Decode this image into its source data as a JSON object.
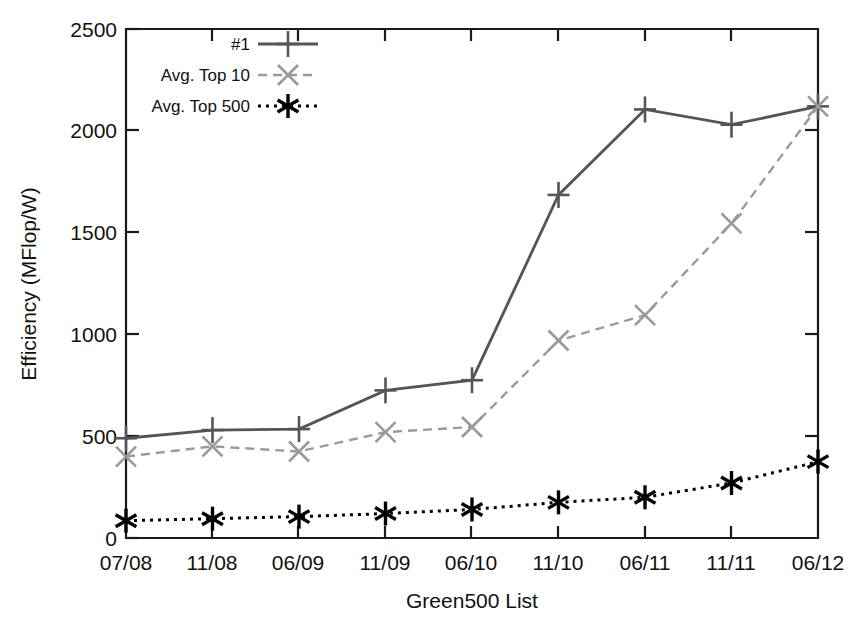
{
  "chart_data": {
    "type": "line",
    "title": "",
    "xlabel": "Green500 List",
    "ylabel": "Efficiency (MFlop/W)",
    "categories": [
      "07/08",
      "11/08",
      "06/09",
      "11/09",
      "06/10",
      "11/10",
      "06/11",
      "11/11",
      "06/12"
    ],
    "xtick_labels": [
      "07/08",
      "11/08",
      "06/09",
      "11/09",
      "06/10",
      "11/10",
      "06/11",
      "11/11",
      "06/12"
    ],
    "ytick_labels": [
      "0",
      "500",
      "1000",
      "1500",
      "2000",
      "2500"
    ],
    "ytick_values": [
      0,
      500,
      1000,
      1500,
      2000,
      2500
    ],
    "ylim": [
      0,
      2500
    ],
    "grid": false,
    "legend_position": "top-left-inside",
    "series": [
      {
        "name": "#1",
        "values": [
          490,
          530,
          535,
          725,
          775,
          1685,
          2105,
          2030,
          2120
        ],
        "color": "#555555",
        "line_style": "solid",
        "marker": "plus"
      },
      {
        "name": "Avg. Top 10",
        "values": [
          400,
          450,
          425,
          520,
          545,
          970,
          1095,
          1545,
          2120
        ],
        "color": "#9a9a9a",
        "line_style": "dashed",
        "marker": "x"
      },
      {
        "name": "Avg. Top 500",
        "values": [
          85,
          95,
          105,
          120,
          140,
          175,
          200,
          270,
          375
        ],
        "color": "#000000",
        "line_style": "dotted",
        "marker": "asterisk"
      }
    ]
  },
  "axes": {
    "y_title": "Efficiency (MFlop/W)",
    "x_title": "Green500 List"
  },
  "legend": {
    "entries": [
      {
        "label": "#1"
      },
      {
        "label": "Avg. Top 10"
      },
      {
        "label": "Avg. Top 500"
      }
    ]
  },
  "ytick_text": {
    "t0": "0",
    "t1": "500",
    "t2": "1000",
    "t3": "1500",
    "t4": "2000",
    "t5": "2500"
  },
  "xtick_text": {
    "t0": "07/08",
    "t1": "11/08",
    "t2": "06/09",
    "t3": "11/09",
    "t4": "06/10",
    "t5": "11/10",
    "t6": "06/11",
    "t7": "11/11",
    "t8": "06/12"
  }
}
